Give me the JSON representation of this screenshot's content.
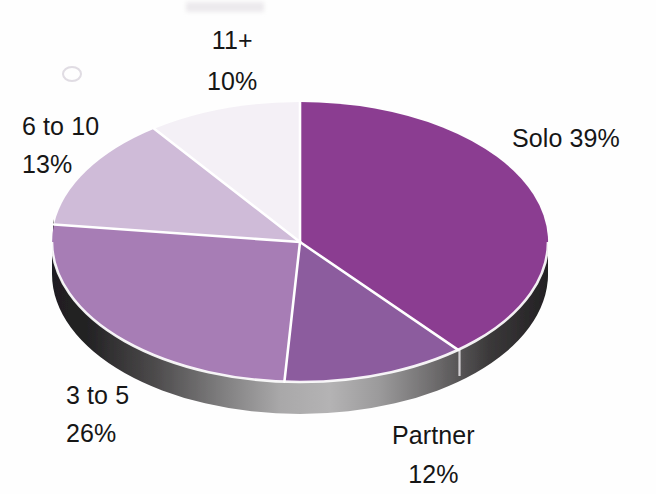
{
  "page": {
    "background_color": "#fefefe",
    "text_color": "#161616"
  },
  "chart_data": {
    "type": "pie",
    "title": "",
    "subtitle": "",
    "xlabel": "",
    "ylabel": "",
    "style": "3d-pie",
    "legend_position": "none",
    "labels_position": "outside",
    "grid": false,
    "start_angle_deg": 0,
    "direction": "clockwise",
    "categories": [
      "Solo",
      "Partner",
      "3 to 5",
      "6 to 10",
      "11+"
    ],
    "values": [
      39,
      12,
      26,
      13,
      10
    ],
    "units": "percent",
    "total": 100,
    "slices": [
      {
        "name": "Solo",
        "label_text": "Solo 39%",
        "label_lines": [
          "Solo 39%"
        ],
        "value": 39,
        "value_text": "39%",
        "color": "#8b3d91",
        "side_color": "#2c2a2d",
        "start_deg": 0,
        "end_deg": 140.4
      },
      {
        "name": "Partner",
        "label_text": "Partner 12%",
        "label_lines": [
          "Partner",
          "12%"
        ],
        "value": 12,
        "value_text": "12%",
        "color": "#8c5c9e",
        "side_color": "#6f6f71",
        "start_deg": 140.4,
        "end_deg": 183.6
      },
      {
        "name": "3 to 5",
        "label_text": "3 to 5 26%",
        "label_lines": [
          "3 to 5",
          "26%"
        ],
        "value": 26,
        "value_text": "26%",
        "color": "#a77db5",
        "side_color": "#3a3839",
        "start_deg": 183.6,
        "end_deg": 277.2
      },
      {
        "name": "6 to 10",
        "label_text": "6 to 10 13%",
        "label_lines": [
          "6 to 10",
          "13%"
        ],
        "value": 13,
        "value_text": "13%",
        "color": "#cfbbd8",
        "side_color": "#cfbbd8",
        "start_deg": 277.2,
        "end_deg": 324.0
      },
      {
        "name": "11+",
        "label_text": "11+ 10%",
        "label_lines": [
          "11+",
          "10%"
        ],
        "value": 10,
        "value_text": "10%",
        "color": "#f4f0f6",
        "side_color": "#f4f0f6",
        "start_deg": 324.0,
        "end_deg": 360.0
      }
    ],
    "colors": [
      "#8b3d91",
      "#8c5c9e",
      "#a77db5",
      "#cfbbd8",
      "#f4f0f6"
    ],
    "separator_color": "#ffffff"
  },
  "labels": {
    "solo": {
      "line1": "Solo 39%"
    },
    "partner": {
      "line1": "Partner",
      "line2": "12%"
    },
    "three_to_five": {
      "line1": "3 to 5",
      "line2": "26%"
    },
    "six_to_ten": {
      "line1": "6 to 10",
      "line2": "13%"
    },
    "eleven_plus": {
      "line1": "11+",
      "line2": "10%"
    }
  }
}
